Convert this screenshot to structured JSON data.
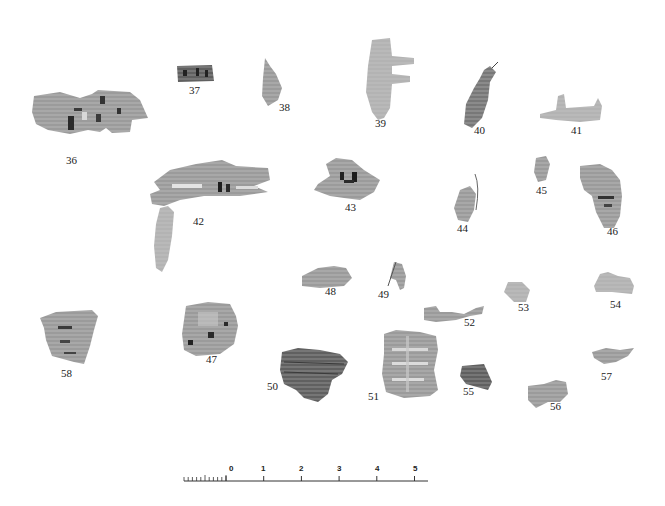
{
  "plate": {
    "background": "#ffffff",
    "fragment_color": "#9a9a9a",
    "ink_color": "#2a2a2a"
  },
  "fragments": [
    {
      "id": "36",
      "label": "36",
      "label_pos": [
        66,
        160
      ]
    },
    {
      "id": "37",
      "label": "37",
      "label_pos": [
        189,
        90
      ]
    },
    {
      "id": "38",
      "label": "38",
      "label_pos": [
        279,
        107
      ]
    },
    {
      "id": "39",
      "label": "39",
      "label_pos": [
        375,
        123
      ]
    },
    {
      "id": "40",
      "label": "40",
      "label_pos": [
        474,
        130
      ]
    },
    {
      "id": "41",
      "label": "41",
      "label_pos": [
        571,
        130
      ]
    },
    {
      "id": "42",
      "label": "42",
      "label_pos": [
        193,
        221
      ]
    },
    {
      "id": "43",
      "label": "43",
      "label_pos": [
        345,
        207
      ]
    },
    {
      "id": "44",
      "label": "44",
      "label_pos": [
        457,
        228
      ]
    },
    {
      "id": "45",
      "label": "45",
      "label_pos": [
        536,
        190
      ]
    },
    {
      "id": "46",
      "label": "46",
      "label_pos": [
        607,
        231
      ]
    },
    {
      "id": "47",
      "label": "47",
      "label_pos": [
        206,
        359
      ]
    },
    {
      "id": "48",
      "label": "48",
      "label_pos": [
        325,
        291
      ]
    },
    {
      "id": "49",
      "label": "49",
      "label_pos": [
        378,
        294
      ]
    },
    {
      "id": "50",
      "label": "50",
      "label_pos": [
        267,
        386
      ]
    },
    {
      "id": "51",
      "label": "51",
      "label_pos": [
        368,
        396
      ]
    },
    {
      "id": "52",
      "label": "52",
      "label_pos": [
        464,
        322
      ]
    },
    {
      "id": "53",
      "label": "53",
      "label_pos": [
        518,
        307
      ]
    },
    {
      "id": "54",
      "label": "54",
      "label_pos": [
        610,
        304
      ]
    },
    {
      "id": "55",
      "label": "55",
      "label_pos": [
        463,
        391
      ]
    },
    {
      "id": "56",
      "label": "56",
      "label_pos": [
        550,
        406
      ]
    },
    {
      "id": "57",
      "label": "57",
      "label_pos": [
        601,
        376
      ]
    },
    {
      "id": "58",
      "label": "58",
      "label_pos": [
        61,
        373
      ]
    }
  ],
  "scale_bar": {
    "unit_labels": [
      "0",
      "1",
      "2",
      "3",
      "4",
      "5"
    ],
    "label_x": [
      229,
      261,
      299,
      337,
      375,
      413
    ],
    "label_y": 469,
    "baseline_y": 481,
    "x_start": 184,
    "x_end": 428,
    "zero_x": 226,
    "unit_px": 37.7,
    "minor_ticks": 10
  }
}
